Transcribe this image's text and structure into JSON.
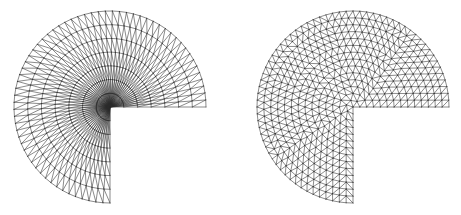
{
  "figure": {
    "meshes": [
      {
        "id": "structured-radial-mesh",
        "kind": "graded radial mesh (fan toward re-entrant corner)",
        "domain_sweep_degrees": 270,
        "radial_layers": 7,
        "angular_segments": 64,
        "line_color": "#2a2a2a"
      },
      {
        "id": "quasi-uniform-mesh",
        "kind": "quasi-uniform unstructured triangulation",
        "domain_sweep_degrees": 270,
        "elements_across_radius": 14,
        "line_color": "#2a2a2a"
      }
    ]
  }
}
